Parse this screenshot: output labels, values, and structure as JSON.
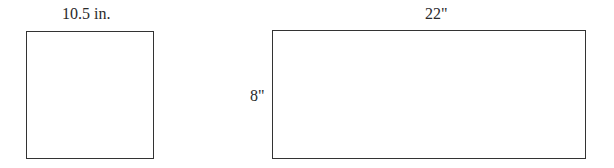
{
  "figures": [
    {
      "shape": "square",
      "labels": {
        "top": "10.5 in."
      }
    },
    {
      "shape": "rectangle",
      "labels": {
        "top": "22\"",
        "left": "8\""
      }
    }
  ]
}
